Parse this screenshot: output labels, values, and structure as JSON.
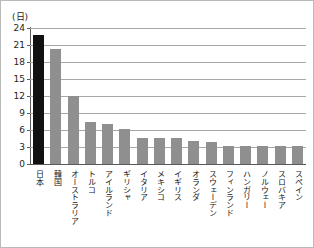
{
  "chart_data": {
    "type": "bar",
    "title": "",
    "subtitle": "",
    "xlabel": "",
    "ylabel": "(日)",
    "unit_caption": "(日)",
    "ylim": [
      0,
      24
    ],
    "yticks": [
      0,
      3,
      6,
      9,
      12,
      15,
      18,
      21,
      24
    ],
    "ytick_labels": [
      "0",
      "3",
      "6",
      "9",
      "12",
      "15",
      "18",
      "21",
      "24"
    ],
    "grid": true,
    "legend": "none",
    "orientation": "vertical",
    "highlight_category": "日本",
    "colors": {
      "highlight_bar": "#111111",
      "bar": "#8f8f8f",
      "gridline": "#a8a8a8",
      "axis": "#5a5a5a",
      "background": "#ffffff",
      "border": "#b9b9b9",
      "text": "#141414"
    },
    "categories": [
      "日本",
      "韓国",
      "オーストラリア",
      "トルコ",
      "アイルランド",
      "ギリシャ",
      "イタリア",
      "メキシコ",
      "イギリス",
      "オランダ",
      "スウェーデン",
      "フィンランド",
      "ハンガリー",
      "ノルウェー",
      "スロバキア",
      "スペイン"
    ],
    "values": [
      22.8,
      20.3,
      12.0,
      7.5,
      7.1,
      6.2,
      4.6,
      4.6,
      4.6,
      4.1,
      3.8,
      3.1,
      3.1,
      3.1,
      3.1,
      3.1
    ]
  }
}
